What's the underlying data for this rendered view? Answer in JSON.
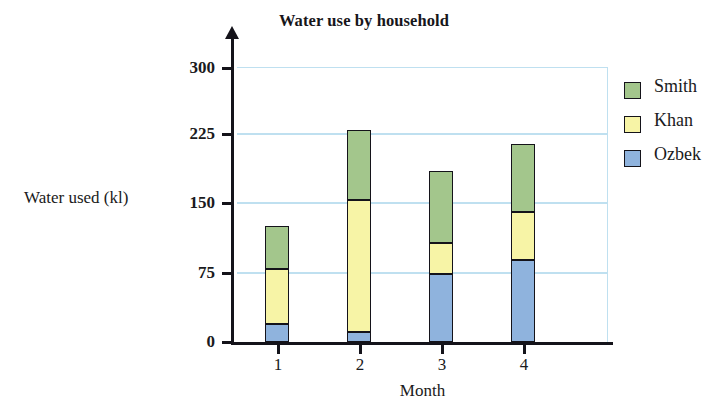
{
  "chart_data": {
    "type": "bar",
    "subtype": "stacked-vertical",
    "title": "Water use by household",
    "xlabel": "Month",
    "ylabel": "Water used (kl)",
    "categories": [
      "1",
      "2",
      "3",
      "4"
    ],
    "ylim": [
      0,
      300
    ],
    "yticks": [
      0,
      75,
      150,
      225,
      300
    ],
    "ytick_labels": [
      "0",
      "75",
      "150",
      "225",
      "300"
    ],
    "grid": true,
    "grid_axis": "y",
    "legend_position": "right",
    "series": [
      {
        "name": "Ozbek",
        "color": "#8fb3dd",
        "values": [
          20,
          11,
          74,
          89
        ]
      },
      {
        "name": "Khan",
        "color": "#f7f4a6",
        "values": [
          60,
          144,
          34,
          53
        ]
      },
      {
        "name": "Smith",
        "color": "#a3c68c",
        "values": [
          47,
          76,
          79,
          74
        ]
      }
    ],
    "totals": [
      127,
      231,
      187,
      216
    ]
  },
  "legend": {
    "items": [
      {
        "label": "Smith",
        "color": "#a3c68c"
      },
      {
        "label": "Khan",
        "color": "#f7f4a6"
      },
      {
        "label": "Ozbek",
        "color": "#8fb3dd"
      }
    ]
  },
  "colors": {
    "green": "#a3c68c",
    "yellow": "#f7f4a6",
    "blue": "#8fb3dd",
    "gridline": "#bfe0f0",
    "axis": "#14131a",
    "text": "#1a1a20",
    "background": "#ffffff"
  }
}
